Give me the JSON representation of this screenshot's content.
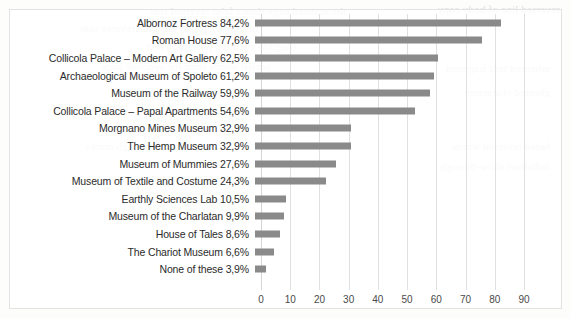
{
  "chart_data": {
    "type": "bar",
    "orientation": "horizontal",
    "title": "",
    "xlabel": "",
    "ylabel": "",
    "xlim": [
      0,
      90
    ],
    "grid": true,
    "legend": false,
    "bar_color": "#8a8a8a",
    "xticks": [
      0,
      10,
      20,
      30,
      40,
      50,
      60,
      70,
      80,
      90
    ],
    "categories": [
      "Albornoz Fortress",
      "Roman House",
      "Collicola Palace – Modern Art Gallery",
      "Archaeological Museum of Spoleto",
      "Museum of the Railway",
      "Collicola Palace – Papal Apartments",
      "Morgnano Mines Museum",
      "The Hemp Museum",
      "Museum of Mummies",
      "Museum of Textile and Costume",
      "Earthly Sciences Lab",
      "Museum of the Charlatan",
      "House of Tales",
      "The Chariot Museum",
      "None of these"
    ],
    "values": [
      84.2,
      77.6,
      62.5,
      61.2,
      59.9,
      54.6,
      32.9,
      32.9,
      27.6,
      24.3,
      10.5,
      9.9,
      8.6,
      6.6,
      3.9
    ],
    "value_labels": [
      "84,2%",
      "77,6%",
      "62,5%",
      "61,2%",
      "59,9%",
      "54,6%",
      "32,9%",
      "32,9%",
      "27,6%",
      "24,3%",
      "10,5%",
      "9,9%",
      "8,6%",
      "6,6%",
      "3,9%"
    ],
    "row_labels": [
      "Albornoz Fortress 84,2%",
      "Roman House 77,6%",
      "Collicola Palace – Modern Art Gallery 62,5%",
      "Archaeological Museum of Spoleto 61,2%",
      "Museum of the Railway 59,9%",
      "Collicola Palace – Papal Apartments 54,6%",
      "Morgnano Mines Museum 32,9%",
      "The Hemp Museum 32,9%",
      "Museum of Mummies 27,6%",
      "Museum of Textile and Costume 24,3%",
      "Earthly Sciences Lab 10,5%",
      "Museum of the Charlatan 9,9%",
      "House of Tales 8,6%",
      "The Chariot Museum 6,6%",
      "None of these 3,9%"
    ]
  },
  "background_bleed": [
    "the scanned page shows faint reversed text",
    "bleeding through from the reverse side",
    "illegible mirrored paragraph text",
    "partial words from the opposite page",
    "faint show-through marks",
    "reversed line of body copy",
    "mirrored text fragment",
    "ghosted characters",
    "faded reversed words",
    "indistinct show-through"
  ]
}
